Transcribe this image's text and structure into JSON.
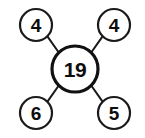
{
  "diagram": {
    "type": "number-wheel",
    "background_color": "#ffffff",
    "stroke_color": "#1a1a1a",
    "text_color": "#0d0d0d",
    "center": {
      "id": "center",
      "value": "19",
      "cx": 75,
      "cy": 69,
      "r": 23
    },
    "nodes": [
      {
        "id": "top-left",
        "value": "4",
        "cx": 36,
        "cy": 25,
        "r": 16
      },
      {
        "id": "top-right",
        "value": "4",
        "cx": 114,
        "cy": 25,
        "r": 16
      },
      {
        "id": "bottom-left",
        "value": "6",
        "cx": 36,
        "cy": 113,
        "r": 16
      },
      {
        "id": "bottom-right",
        "value": "5",
        "cx": 114,
        "cy": 113,
        "r": 16
      }
    ],
    "connectors": [
      {
        "id": "center-to-top-left",
        "x1": 47.6,
        "y1": 36.6,
        "x2": 59.3,
        "y2": 53.3
      },
      {
        "id": "center-to-top-right",
        "x1": 102.4,
        "y1": 36.6,
        "x2": 90.7,
        "y2": 53.3
      },
      {
        "id": "center-to-bottom-left",
        "x1": 47.6,
        "y1": 101.4,
        "x2": 59.3,
        "y2": 84.7
      },
      {
        "id": "center-to-bottom-right",
        "x1": 102.4,
        "y1": 101.4,
        "x2": 90.7,
        "y2": 84.7
      }
    ]
  }
}
